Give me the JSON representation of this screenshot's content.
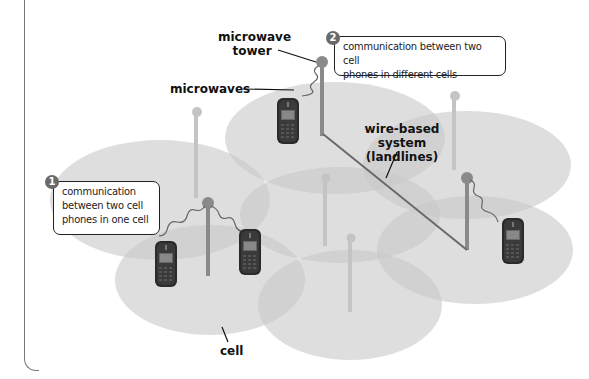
{
  "diagram": {
    "labels": {
      "microwave_tower_line1": "microwave",
      "microwave_tower_line2": "tower",
      "microwaves": "microwaves",
      "wire_based_line1": "wire-based system",
      "wire_based_line2": "(landlines)",
      "cell": "cell"
    },
    "callouts": [
      {
        "number": "1",
        "lines": [
          "communication",
          "between two cell",
          "phones in one cell"
        ]
      },
      {
        "number": "2",
        "lines": [
          "communication between two cell",
          "phones in different cells"
        ]
      }
    ],
    "colors": {
      "cell_fill": "#c8c8c8",
      "cell_overlap": "#a8a8a8",
      "tower": "#8a8a8a",
      "tower_faded": "#c4c4c4",
      "phone_body": "#2a2a2a",
      "badge": "#6a6a6a",
      "frame": "#777777"
    },
    "icons": {
      "tower": "microwave-tower-icon",
      "phone": "cell-phone-icon",
      "wave": "microwave-signal-icon"
    }
  }
}
